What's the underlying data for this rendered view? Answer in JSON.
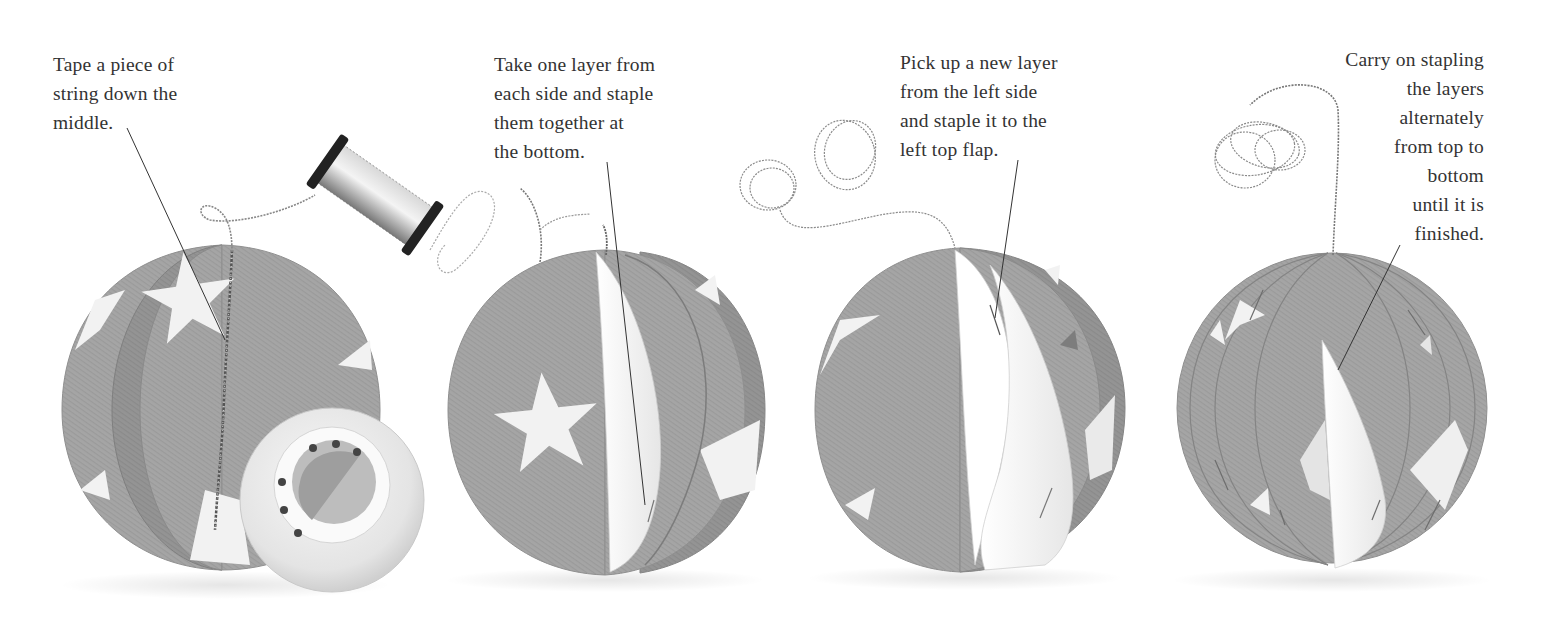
{
  "page": {
    "background": "#ffffff",
    "text_color": "#333333",
    "paper_color": "#a4a4a4",
    "paper_dark": "#8e8e8e",
    "star_color": "#f2f2f2"
  },
  "steps": [
    {
      "number": 1,
      "caption_lines": [
        "Tape a piece of",
        "string down the",
        "middle."
      ],
      "objects": [
        "paper-ball-layers",
        "metallic-thread-spool",
        "tape-roll",
        "string"
      ]
    },
    {
      "number": 2,
      "caption_lines": [
        "Take one layer from",
        "each side and staple",
        "them together at",
        "the bottom."
      ],
      "objects": [
        "paper-ball",
        "white-layer",
        "string"
      ]
    },
    {
      "number": 3,
      "caption_lines": [
        "Pick up a new layer",
        "from the left side",
        "and staple it to the",
        "left top flap."
      ],
      "objects": [
        "paper-ball",
        "white-layers",
        "looped-string"
      ]
    },
    {
      "number": 4,
      "caption_lines": [
        "Carry on stapling",
        "the layers",
        "alternately",
        "from top to",
        "bottom",
        "until it is",
        "finished."
      ],
      "objects": [
        "finished-paper-ball",
        "looped-string"
      ]
    }
  ]
}
